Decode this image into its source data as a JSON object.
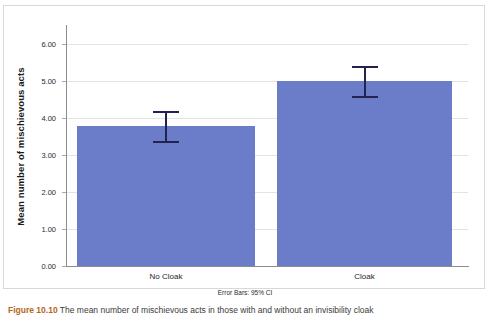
{
  "chart_data": {
    "type": "bar",
    "title": "",
    "subtitle": "",
    "xlabel": "",
    "ylabel": "Mean number of mischievous acts",
    "categories": [
      "No Cloak",
      "Cloak"
    ],
    "values": [
      3.78,
      5.0
    ],
    "errors": [
      {
        "category": "No Cloak",
        "value": 3.78,
        "lower": 3.38,
        "upper": 4.17
      },
      {
        "category": "Cloak",
        "value": 5.0,
        "lower": 4.58,
        "upper": 5.39
      }
    ],
    "error_note": "Error Bars: 95% CI",
    "ylim": [
      0.0,
      6.5
    ],
    "yticks": [
      0.0,
      1.0,
      2.0,
      3.0,
      4.0,
      5.0,
      6.0
    ],
    "ytick_labels": [
      "0.00",
      "1.00",
      "2.00",
      "3.00",
      "4.00",
      "5.00",
      "6.00"
    ],
    "grid": true,
    "legend": "none",
    "bar_color": "#6b7cc9",
    "error_color": "#23234f"
  },
  "caption": {
    "number": "Figure 10.10",
    "text": "The mean number of mischievous acts in those with and without an invisibility cloak"
  }
}
